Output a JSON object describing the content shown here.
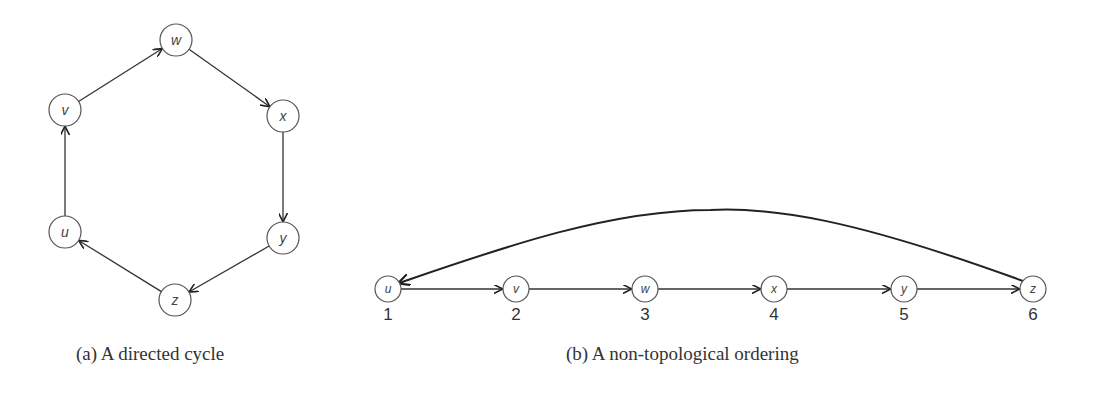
{
  "figure_a": {
    "caption": "(a)  A directed cycle",
    "nodes": [
      {
        "id": "w",
        "label": "w",
        "x": 176,
        "y": 40
      },
      {
        "id": "v",
        "label": "v",
        "x": 65,
        "y": 110
      },
      {
        "id": "x",
        "label": "x",
        "x": 283,
        "y": 116
      },
      {
        "id": "u",
        "label": "u",
        "x": 65,
        "y": 232
      },
      {
        "id": "y",
        "label": "y",
        "x": 283,
        "y": 238
      },
      {
        "id": "z",
        "label": "z",
        "x": 175,
        "y": 300
      }
    ],
    "edges": [
      [
        "u",
        "v"
      ],
      [
        "v",
        "w"
      ],
      [
        "w",
        "x"
      ],
      [
        "x",
        "y"
      ],
      [
        "y",
        "z"
      ],
      [
        "z",
        "u"
      ]
    ]
  },
  "figure_b": {
    "caption": "(b)  A non-topological ordering",
    "nodes": [
      {
        "id": "u",
        "label": "u",
        "order": "1",
        "x": 388,
        "y": 289
      },
      {
        "id": "v",
        "label": "v",
        "order": "2",
        "x": 516,
        "y": 289
      },
      {
        "id": "w",
        "label": "w",
        "order": "3",
        "x": 645,
        "y": 289
      },
      {
        "id": "x",
        "label": "x",
        "order": "4",
        "x": 774,
        "y": 289
      },
      {
        "id": "y",
        "label": "y",
        "order": "5",
        "x": 904,
        "y": 289
      },
      {
        "id": "z",
        "label": "z",
        "order": "6",
        "x": 1033,
        "y": 289
      }
    ],
    "edges": [
      [
        "u",
        "v"
      ],
      [
        "v",
        "w"
      ],
      [
        "w",
        "x"
      ],
      [
        "x",
        "y"
      ],
      [
        "y",
        "z"
      ]
    ],
    "back_edge": [
      "z",
      "u"
    ]
  }
}
